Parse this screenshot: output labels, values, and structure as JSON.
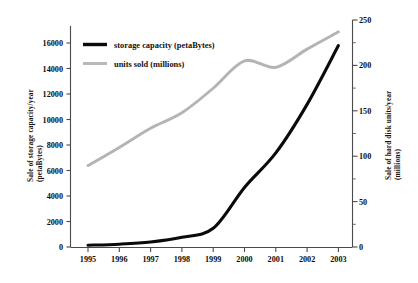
{
  "chart_data": {
    "type": "line",
    "title": "",
    "xlabel": "",
    "ylabel": "Sale of storage capacity/year (petaBytes)",
    "y2label": "Sale of hard disk units/year (millions)",
    "categories": [
      "1995",
      "1996",
      "1997",
      "1998",
      "1999",
      "2000",
      "2001",
      "2002",
      "2003"
    ],
    "x": [
      1995,
      1996,
      1997,
      1998,
      1999,
      2000,
      2001,
      2002,
      2003
    ],
    "ylim": [
      0,
      17000
    ],
    "y2lim": [
      0,
      250
    ],
    "grid": false,
    "legend_position": "upper-left-inside",
    "series": [
      {
        "name": "storage capacity (petaBytes)",
        "axis": "left",
        "color": "#0a0a0a",
        "values": [
          180,
          260,
          430,
          800,
          1500,
          4700,
          7400,
          11200,
          15800
        ]
      },
      {
        "name": "units sold (millions)",
        "axis": "right",
        "color": "#b4b4b4",
        "values": [
          90,
          110,
          131,
          148,
          175,
          205,
          198,
          218,
          237
        ]
      }
    ],
    "left_axis": {
      "label_line1": "Sale of storage capacity/year",
      "label_line2": "(petaBytes)",
      "ticks": [
        "0",
        "2000",
        "4000",
        "6000",
        "8000",
        "10000",
        "12000",
        "14000",
        "16000"
      ],
      "tick_values": [
        0,
        2000,
        4000,
        6000,
        8000,
        10000,
        12000,
        14000,
        16000
      ],
      "min": 0,
      "max": 17000
    },
    "right_axis": {
      "label_line1": "Sale of hard disk units/year",
      "label_line2": "(millions)",
      "ticks": [
        "0",
        "50",
        "100",
        "150",
        "200",
        "250"
      ],
      "tick_values": [
        0,
        50,
        100,
        150,
        200,
        250
      ],
      "minor_tick_values": [
        25,
        75,
        125,
        175,
        225
      ],
      "min": 0,
      "max": 250
    },
    "x_axis": {
      "ticks": [
        "1995",
        "1996",
        "1997",
        "1998",
        "1999",
        "2000",
        "2001",
        "2002",
        "2003"
      ]
    },
    "legend": [
      {
        "label": "storage capacity (petaBytes)",
        "color": "#0a0a0a"
      },
      {
        "label": "units sold (millions)",
        "color": "#b9b9b9"
      }
    ]
  }
}
